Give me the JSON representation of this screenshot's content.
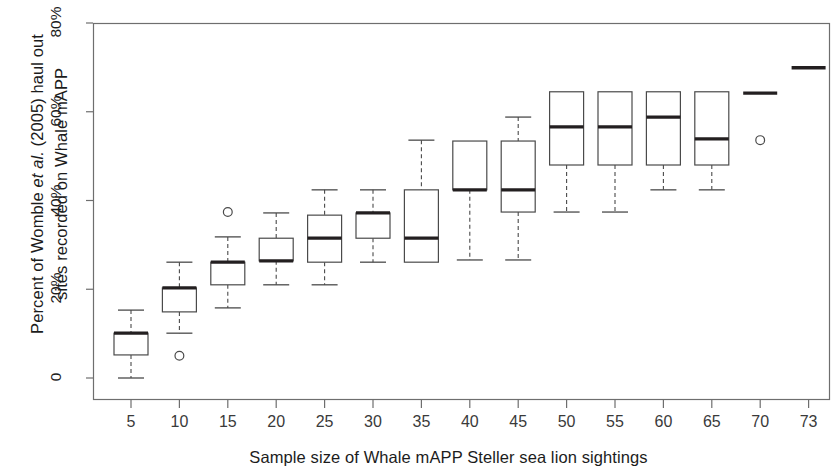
{
  "chart_data": {
    "type": "box",
    "title": "",
    "xlabel": "Sample size of Whale mAPP Steller sea lion sightings",
    "ylabel_line1_pre": "Percent of  Womble ",
    "ylabel_italic": "et al.",
    "ylabel_line1_post": " (2005) haul out",
    "ylabel_line2": "sites recorded on Whale mAPP",
    "ylabel_plain": "Percent of Womble et al. (2005) haul out sites recorded on Whale mAPP",
    "ytick_labels": [
      "0",
      "20%",
      "40%",
      "60%",
      "80%"
    ],
    "ytick_values": [
      0,
      20,
      40,
      60,
      80
    ],
    "ylim": [
      0,
      80
    ],
    "grid": false,
    "categories": [
      "5",
      "10",
      "15",
      "20",
      "25",
      "30",
      "35",
      "40",
      "45",
      "50",
      "55",
      "60",
      "65",
      "70",
      "73"
    ],
    "x_values": [
      5,
      10,
      15,
      20,
      25,
      30,
      35,
      40,
      45,
      50,
      55,
      60,
      65,
      70,
      73
    ],
    "boxes": [
      {
        "category": "5",
        "min": 0.0,
        "q1": 5.2,
        "median": 10.1,
        "q3": 10.1,
        "max": 15.3,
        "outliers": []
      },
      {
        "category": "10",
        "min": 10.1,
        "q1": 14.9,
        "median": 20.3,
        "q3": 20.3,
        "max": 26.1,
        "outliers": [
          5.0
        ]
      },
      {
        "category": "15",
        "min": 15.8,
        "q1": 21.0,
        "median": 26.1,
        "q3": 26.1,
        "max": 31.8,
        "outliers": [
          37.4
        ]
      },
      {
        "category": "20",
        "min": 21.0,
        "q1": 26.4,
        "median": 26.4,
        "q3": 31.5,
        "max": 37.2,
        "outliers": []
      },
      {
        "category": "25",
        "min": 21.0,
        "q1": 26.1,
        "median": 31.5,
        "q3": 36.7,
        "max": 42.4,
        "outliers": []
      },
      {
        "category": "30",
        "min": 26.1,
        "q1": 31.5,
        "median": 37.2,
        "q3": 37.2,
        "max": 42.4,
        "outliers": []
      },
      {
        "category": "35",
        "min": 26.1,
        "q1": 26.1,
        "median": 31.5,
        "q3": 42.4,
        "max": 53.6,
        "outliers": []
      },
      {
        "category": "40",
        "min": 26.6,
        "q1": 42.4,
        "median": 42.4,
        "q3": 53.4,
        "max": 53.4,
        "outliers": []
      },
      {
        "category": "45",
        "min": 26.6,
        "q1": 37.4,
        "median": 42.4,
        "q3": 53.4,
        "max": 58.8,
        "outliers": []
      },
      {
        "category": "50",
        "min": 37.4,
        "q1": 48.0,
        "median": 56.6,
        "q3": 64.5,
        "max": 64.5,
        "outliers": []
      },
      {
        "category": "55",
        "min": 37.4,
        "q1": 48.0,
        "median": 56.6,
        "q3": 64.5,
        "max": 64.5,
        "outliers": []
      },
      {
        "category": "60",
        "min": 42.4,
        "q1": 48.0,
        "median": 58.8,
        "q3": 64.5,
        "max": 64.5,
        "outliers": []
      },
      {
        "category": "65",
        "min": 42.4,
        "q1": 48.0,
        "median": 53.9,
        "q3": 64.5,
        "max": 64.5,
        "outliers": []
      },
      {
        "category": "70",
        "min": 64.2,
        "q1": 64.2,
        "median": 64.2,
        "q3": 64.2,
        "max": 64.2,
        "outliers": [
          53.6
        ]
      },
      {
        "category": "73",
        "min": 69.9,
        "q1": 69.9,
        "median": 69.9,
        "q3": 69.9,
        "max": 69.9,
        "outliers": []
      }
    ]
  },
  "style": {
    "axis_color": "#6e6e6e",
    "box_color": "#4a4a4a",
    "median_color": "#231f20",
    "background": "#ffffff"
  }
}
